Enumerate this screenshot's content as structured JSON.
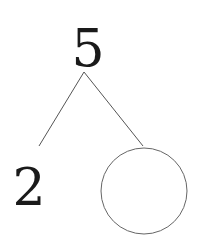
{
  "diagram": {
    "type": "number-bond",
    "whole": "5",
    "parts": [
      "2",
      ""
    ],
    "colors": {
      "text": "#1a1a1a",
      "line": "#555555",
      "background": "#ffffff"
    }
  }
}
